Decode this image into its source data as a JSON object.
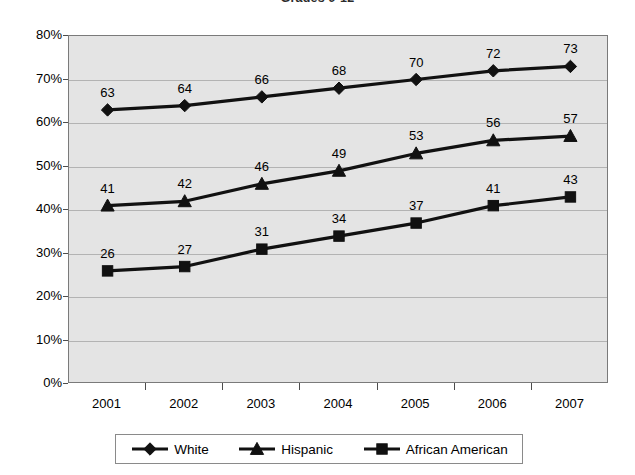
{
  "chart_data": {
    "type": "line",
    "title": "Grades 9-12",
    "xlabel": "",
    "ylabel": "",
    "categories": [
      "2001",
      "2002",
      "2003",
      "2004",
      "2005",
      "2006",
      "2007"
    ],
    "series": [
      {
        "name": "White",
        "marker": "diamond",
        "color": "#111111",
        "values": [
          63,
          64,
          66,
          68,
          70,
          72,
          73
        ]
      },
      {
        "name": "Hispanic",
        "marker": "triangle",
        "color": "#111111",
        "values": [
          41,
          42,
          46,
          49,
          53,
          56,
          57
        ]
      },
      {
        "name": "African American",
        "marker": "square",
        "color": "#111111",
        "values": [
          26,
          27,
          31,
          34,
          37,
          41,
          43
        ]
      }
    ],
    "ylim": [
      0,
      80
    ],
    "y_tick_values": [
      0,
      10,
      20,
      30,
      40,
      50,
      60,
      70,
      80
    ],
    "y_tick_labels": [
      "0%",
      "10%",
      "20%",
      "30%",
      "40%",
      "50%",
      "60%",
      "70%",
      "80%"
    ],
    "grid": true,
    "legend_position": "bottom",
    "plot_background": "#e4e4e4",
    "gridline_color": "#b3b3b3",
    "data_labels": true
  }
}
